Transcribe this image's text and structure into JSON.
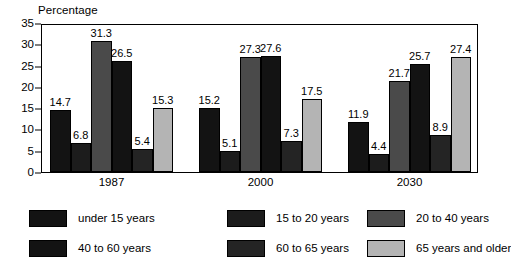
{
  "chart_data": {
    "type": "bar",
    "title": "",
    "ylabel": "Percentage",
    "xlabel": "",
    "categories": [
      "1987",
      "2000",
      "2030"
    ],
    "ylim": [
      0,
      35
    ],
    "yticks": [
      0,
      5,
      10,
      15,
      20,
      25,
      30,
      35
    ],
    "ytick_labels": [
      "0",
      "5",
      "10",
      "15",
      "20",
      "25",
      "30",
      "35"
    ],
    "grid": false,
    "legend_position": "bottom",
    "series": [
      {
        "name": "under 15 years",
        "color": "#131313",
        "values": [
          14.7,
          15.2,
          11.9
        ]
      },
      {
        "name": "15 to 20 years",
        "color": "#1c1c1c",
        "values": [
          6.8,
          5.1,
          4.4
        ]
      },
      {
        "name": "20 to 40 years",
        "color": "#4a4a4a",
        "values": [
          31.3,
          27.3,
          21.7
        ]
      },
      {
        "name": "40 to 60 years",
        "color": "#131313",
        "values": [
          26.5,
          27.6,
          25.7
        ]
      },
      {
        "name": "60 to 65 years",
        "color": "#242424",
        "values": [
          5.4,
          7.3,
          8.9
        ]
      },
      {
        "name": "65 years and older",
        "color": "#b4b4b4",
        "values": [
          15.3,
          17.5,
          27.4
        ]
      }
    ]
  },
  "legend": {
    "items": [
      {
        "label": "under 15 years",
        "color": "#131313"
      },
      {
        "label": "15 to 20 years",
        "color": "#1c1c1c"
      },
      {
        "label": "20 to 40 years",
        "color": "#4a4a4a"
      },
      {
        "label": "40 to 60 years",
        "color": "#131313"
      },
      {
        "label": "60 to 65 years",
        "color": "#242424"
      },
      {
        "label": "65 years and older",
        "color": "#b4b4b4"
      }
    ]
  }
}
